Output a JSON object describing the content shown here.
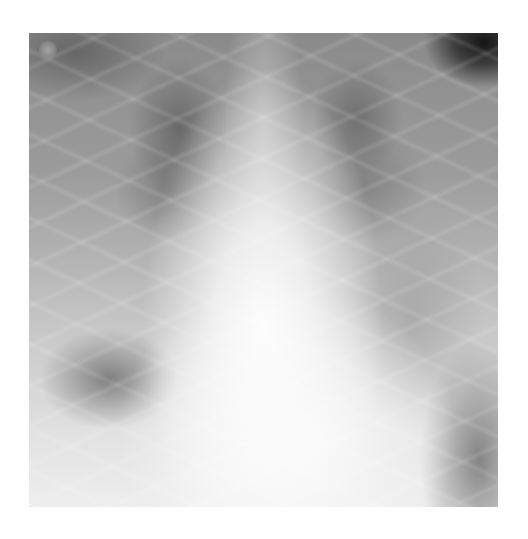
{
  "image": {
    "subject": "chest-radiograph",
    "view": "frontal",
    "description": "Grayscale frontal chest X-ray showing bilateral lung fields with patchy opacities, bright central mediastinum and heart shadow, and a dark region in the upper right corner."
  }
}
